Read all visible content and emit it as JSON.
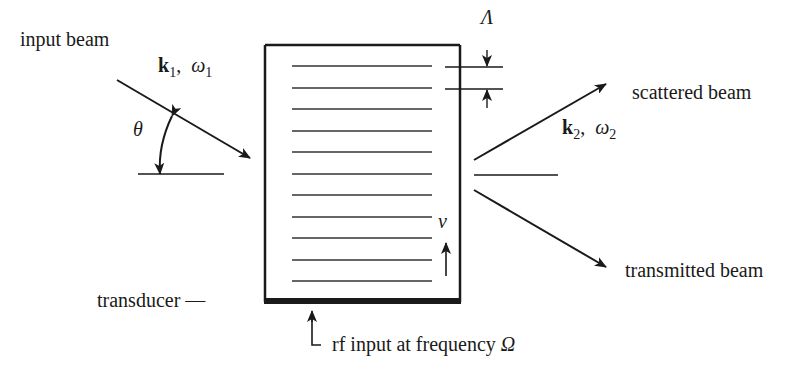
{
  "diagram": {
    "type": "acousto-optic modulator (Bragg cell)",
    "labels": {
      "input_beam": "input beam",
      "scattered_beam": "scattered beam",
      "transmitted_beam": "transmitted beam",
      "transducer": "transducer —",
      "rf_input": "rf input at frequency",
      "rf_symbol": "Ω",
      "wavelength_symbol": "Λ",
      "velocity_symbol": "v",
      "angle_symbol": "θ",
      "k1": "k",
      "k1_sub": "1",
      "omega1": "ω",
      "omega1_sub": "1",
      "k2": "k",
      "k2_sub": "2",
      "omega2": "ω",
      "omega2_sub": "2",
      "comma": ","
    },
    "grating_line_count": 12,
    "colors": {
      "stroke": "#1a1a1a",
      "background": "#ffffff"
    }
  }
}
